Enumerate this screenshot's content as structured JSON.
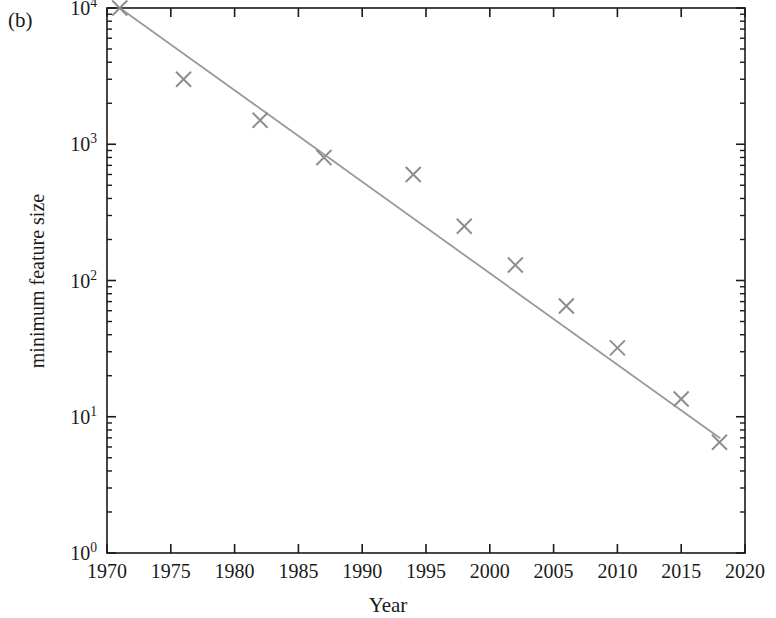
{
  "figure": {
    "panel_label": "(b)",
    "background_color": "#ffffff",
    "axis_color": "#1a1a1a",
    "marker_color": "#8c8c8c",
    "line_color": "#9a9a9a"
  },
  "chart_data": {
    "type": "scatter",
    "title": "",
    "xlabel": "Year",
    "ylabel": "minimum feature size",
    "xlim": [
      1970,
      2020
    ],
    "ylim": [
      1,
      10000
    ],
    "yscale": "log",
    "xscale": "linear",
    "grid": false,
    "legend": null,
    "xticks": [
      1970,
      1975,
      1980,
      1985,
      1990,
      1995,
      2000,
      2005,
      2010,
      2015,
      2020
    ],
    "xticklabels": [
      "1970",
      "1975",
      "1980",
      "1985",
      "1990",
      "1995",
      "2000",
      "2005",
      "2010",
      "2015",
      "2020"
    ],
    "yticks": [
      1,
      10,
      100,
      1000,
      10000
    ],
    "yticklabels": [
      "10⁰",
      "10¹",
      "10²",
      "10³",
      "10⁴"
    ],
    "ytick_mantissas": [
      "0",
      "1",
      "2",
      "3",
      "4"
    ],
    "minor_ticks": true,
    "marker": "x",
    "x": [
      1971,
      1976,
      1982,
      1987,
      1994,
      1998,
      2002,
      2006,
      2010,
      2015,
      2018
    ],
    "y": [
      10000,
      3000,
      1500,
      800,
      600,
      250,
      130,
      65,
      32,
      13.5,
      6.5
    ],
    "series": [
      {
        "name": "minimum feature size",
        "x": [
          1971,
          1976,
          1982,
          1987,
          1994,
          1998,
          2002,
          2006,
          2010,
          2015,
          2018
        ],
        "values": [
          10000,
          3000,
          1500,
          800,
          600,
          250,
          130,
          65,
          32,
          13.5,
          6.5
        ]
      },
      {
        "name": "trend line",
        "type": "line",
        "x": [
          1971,
          2018
        ],
        "values": [
          10000,
          7.0
        ]
      }
    ]
  }
}
